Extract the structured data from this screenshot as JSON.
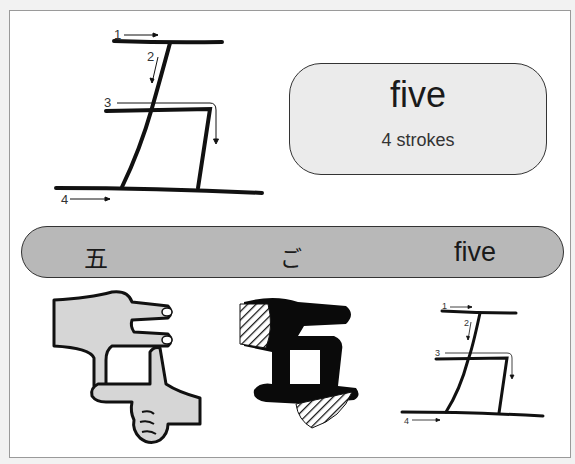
{
  "stroke_diagram_large": {
    "stroke_numbers": [
      "1",
      "2",
      "3",
      "4"
    ]
  },
  "info_box": {
    "meaning": "five",
    "stroke_count": "4 strokes"
  },
  "reading_band": {
    "kanji": "五",
    "reading": "ご",
    "meaning": "five"
  },
  "illustrations": {
    "hand_mnemonic": "hands-forming-character",
    "silhouette": "character-silhouette",
    "stroke_diagram_small": {
      "stroke_numbers": [
        "1",
        "2",
        "3",
        "4"
      ]
    }
  },
  "colors": {
    "band_fill": "#b8b8b8",
    "box_fill": "#ebebeb",
    "stroke": "#111111",
    "frame_border": "#9a9a9a"
  }
}
